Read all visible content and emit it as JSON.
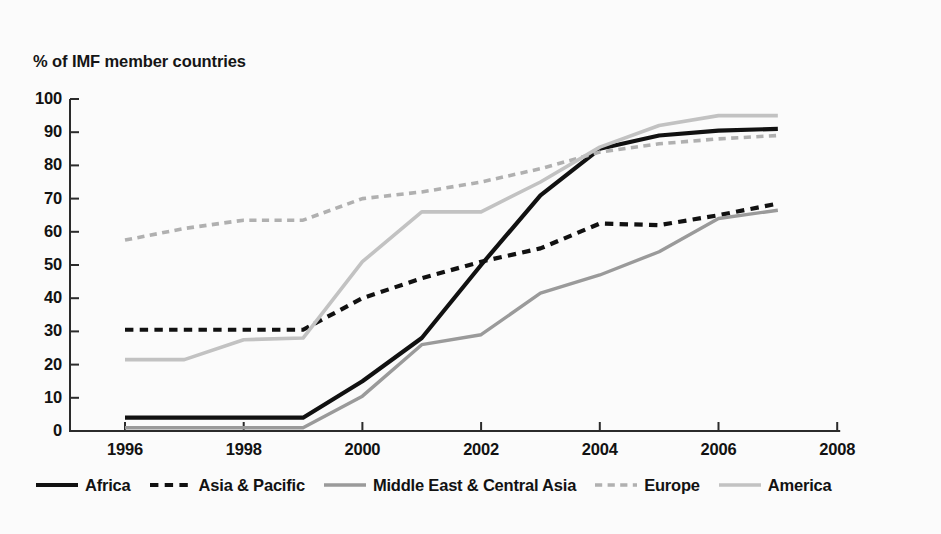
{
  "chart_data": {
    "type": "line",
    "title": "",
    "ylabel": "% of IMF member countries",
    "xlabel": "",
    "xlim": [
      1995.5,
      2008.5
    ],
    "ylim": [
      0,
      100
    ],
    "grid": false,
    "legend_position": "bottom",
    "x": [
      1996,
      1997,
      1998,
      1999,
      2000,
      2001,
      2002,
      2003,
      2004,
      2005,
      2006,
      2007
    ],
    "xticks": [
      "1996",
      "1998",
      "2000",
      "2002",
      "2004",
      "2006",
      "2008"
    ],
    "xtick_values": [
      1996,
      1998,
      2000,
      2002,
      2004,
      2006,
      2008
    ],
    "yticks": [
      "0",
      "10",
      "20",
      "30",
      "40",
      "50",
      "60",
      "70",
      "80",
      "90",
      "100"
    ],
    "ytick_values": [
      0,
      10,
      20,
      30,
      40,
      50,
      60,
      70,
      80,
      90,
      100
    ],
    "series": [
      {
        "name": "Africa",
        "style": "solid",
        "color": "#111111",
        "width": 4.2,
        "values": [
          4,
          4,
          4,
          4,
          15,
          28,
          50,
          71,
          85,
          89,
          90.5,
          91
        ]
      },
      {
        "name": "Asia & Pacific",
        "style": "dashed",
        "color": "#111111",
        "width": 4.2,
        "values": [
          30.5,
          30.5,
          30.5,
          30.5,
          40,
          46,
          51,
          55,
          62.5,
          62,
          65,
          68.5
        ]
      },
      {
        "name": "Middle East & Central Asia",
        "style": "solid",
        "color": "#9a9a9a",
        "width": 3.4,
        "values": [
          1,
          1,
          1,
          1,
          10.5,
          26,
          29,
          41.5,
          47,
          54,
          64,
          66.5
        ]
      },
      {
        "name": "Europe",
        "style": "dashed",
        "color": "#b0b0b0",
        "width": 3.6,
        "values": [
          57.5,
          61,
          63.5,
          63.5,
          70,
          72,
          75,
          79,
          84,
          86.5,
          88,
          89
        ]
      },
      {
        "name": "America",
        "style": "solid",
        "color": "#c2c2c2",
        "width": 3.6,
        "values": [
          21.5,
          21.5,
          27.5,
          28,
          51,
          66,
          66,
          75,
          85.5,
          92,
          95,
          95
        ]
      }
    ]
  },
  "legend": {
    "items": [
      {
        "label": "Africa"
      },
      {
        "label": "Asia & Pacific"
      },
      {
        "label": "Middle East & Central Asia"
      },
      {
        "label": "Europe"
      },
      {
        "label": "America"
      }
    ]
  }
}
